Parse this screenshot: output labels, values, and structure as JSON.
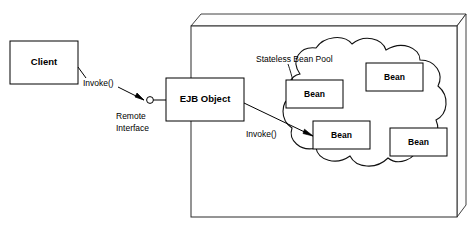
{
  "diagram": {
    "type": "architecture-diagram",
    "colors": {
      "stroke": "#000000",
      "container_stroke": "#2b2b2b",
      "background": "#ffffff",
      "text": "#000000"
    },
    "nodes": {
      "client": {
        "label": "Client",
        "shape": "rectangle",
        "x": 10,
        "y": 41,
        "width": 68,
        "height": 43
      },
      "ejb_object": {
        "label": "EJB Object",
        "shape": "rectangle",
        "x": 166,
        "y": 78,
        "width": 78,
        "height": 43
      },
      "container": {
        "label": "EJB Container",
        "shape": "3d-box",
        "x": 191,
        "y": 14,
        "width": 275,
        "height": 203
      },
      "pool": {
        "label": "Stateless Bean Pool",
        "shape": "cloud"
      },
      "beans": [
        {
          "label": "Bean",
          "x": 286,
          "y": 80,
          "width": 57,
          "height": 28
        },
        {
          "label": "Bean",
          "x": 366,
          "y": 63,
          "width": 57,
          "height": 28
        },
        {
          "label": "Bean",
          "x": 313,
          "y": 121,
          "width": 57,
          "height": 28
        },
        {
          "label": "Bean",
          "x": 390,
          "y": 128,
          "width": 57,
          "height": 28
        }
      ]
    },
    "annotations": {
      "invoke_remote": "Invoke()",
      "remote_interface_line1": "Remote",
      "remote_interface_line2": "Interface",
      "invoke_bean": "Invoke()",
      "pool_label": "Stateless Bean Pool"
    },
    "connectors": [
      {
        "name": "client-to-remote-interface",
        "label": "Invoke()",
        "from": "client",
        "to": "remote-interface-lollipop",
        "arrow": true
      },
      {
        "name": "remote-interface-to-ejb-object",
        "label": "",
        "from": "remote-interface-lollipop",
        "to": "ejb_object",
        "arrow": false
      },
      {
        "name": "ejb-object-to-bean",
        "label": "Invoke()",
        "from": "ejb_object",
        "to": "bean-3",
        "arrow": true
      },
      {
        "name": "pool-label-leader",
        "label": "",
        "from": "pool_label",
        "to": "cloud",
        "arrow": false
      }
    ]
  }
}
